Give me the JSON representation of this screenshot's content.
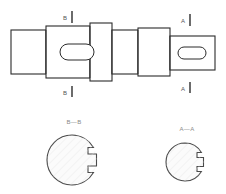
{
  "drawing": {
    "title": "Stepped Shaft with Keyways",
    "type": "mechanical-part-drawing",
    "background_color": "#ffffff",
    "line_color": "#2b2b2b",
    "hatch_color": "#e2e2e2",
    "label_color": "#555555"
  },
  "front_view": {
    "name": "shaft-front-view",
    "description": "Horizontal stepped cylindrical shaft shown in elevation",
    "segments": [
      {
        "id": "seg-1",
        "label": "left-end-journal",
        "x": 11,
        "width": 35,
        "top": 30,
        "bottom": 74
      },
      {
        "id": "seg-2",
        "label": "left-keyway-boss",
        "x": 46,
        "width": 44,
        "top": 26,
        "bottom": 78
      },
      {
        "id": "seg-3",
        "label": "center-collar",
        "x": 90,
        "width": 22,
        "top": 23,
        "bottom": 81
      },
      {
        "id": "seg-4",
        "label": "mid-journal",
        "x": 112,
        "width": 26,
        "top": 30,
        "bottom": 74
      },
      {
        "id": "seg-5",
        "label": "taper-step",
        "x": 138,
        "width": 32,
        "top": 28,
        "bottom": 76
      },
      {
        "id": "seg-6",
        "label": "right-keyway-boss",
        "x": 170,
        "width": 45,
        "top": 36,
        "bottom": 70
      }
    ],
    "keyways": [
      {
        "id": "keyway-left",
        "label": "left-keyway-slot",
        "cx": 77,
        "cy": 52,
        "rx": 17,
        "ry": 8
      },
      {
        "id": "keyway-right",
        "label": "right-keyway-slot",
        "cx": 192,
        "cy": 53,
        "rx": 14,
        "ry": 6
      }
    ]
  },
  "callouts": [
    {
      "id": "callout-b-top",
      "letter": "B",
      "x": 68,
      "y": 17,
      "tick_y1": 11,
      "tick_y2": 23
    },
    {
      "id": "callout-b-bottom",
      "letter": "B",
      "x": 68,
      "y": 93,
      "tick_y1": 86,
      "tick_y2": 97
    },
    {
      "id": "callout-a-top",
      "letter": "A",
      "x": 186,
      "y": 20,
      "tick_y1": 14,
      "tick_y2": 26
    },
    {
      "id": "callout-a-bottom",
      "letter": "A",
      "x": 186,
      "y": 88,
      "tick_y1": 82,
      "tick_y2": 93
    }
  ],
  "section_views": [
    {
      "id": "section-bb",
      "name": "section-view-b-b",
      "title": "B—B",
      "title_x": 74,
      "title_y": 122,
      "cx": 72,
      "cy": 160,
      "r": 25,
      "keyway": {
        "width": 8,
        "height": 12,
        "label": "keyway-notch"
      }
    },
    {
      "id": "section-aa",
      "name": "section-view-a-a",
      "title": "A—A",
      "title_x": 187,
      "title_y": 129,
      "cx": 185,
      "cy": 162,
      "r": 19,
      "keyway": {
        "width": 7,
        "height": 10,
        "label": "keyway-notch"
      }
    }
  ]
}
